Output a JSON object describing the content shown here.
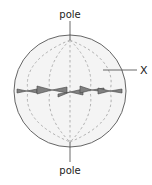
{
  "diagram": {
    "labels": {
      "top_pole": "pole",
      "bottom_pole": "pole",
      "x_marker": "X"
    },
    "colors": {
      "cell_fill": "#f4f4f4",
      "cell_outline": "#666666",
      "spindle": "#b0b0b0",
      "chromosome": "#707070",
      "text": "#222222"
    }
  }
}
